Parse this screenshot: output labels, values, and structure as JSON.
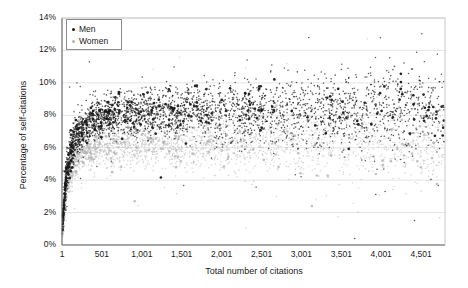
{
  "chart_data": {
    "type": "scatter",
    "title": "",
    "xlabel": "Total number of citations",
    "ylabel": "Percentage of self-citations",
    "xlim": [
      1,
      4800
    ],
    "ylim": [
      0,
      14
    ],
    "xticks": [
      1,
      501,
      1001,
      1501,
      2001,
      2501,
      3001,
      3501,
      4001,
      4501
    ],
    "xticklabels": [
      "1",
      "501",
      "1,001",
      "1,501",
      "2,001",
      "2,501",
      "3,001",
      "3,501",
      "4,001",
      "4,501"
    ],
    "yticks": [
      0,
      2,
      4,
      6,
      8,
      10,
      12,
      14
    ],
    "yticklabels": [
      "0%",
      "2%",
      "4%",
      "6%",
      "8%",
      "10%",
      "12%",
      "14%"
    ],
    "grid": "horizontal",
    "legend_position": "top-left",
    "series": [
      {
        "name": "Men",
        "color": "#1a1a1a",
        "marker": "circle",
        "description": "Dense dark band rising steeply from near 0% at x=1 to about 8% by x=500, then broadly flat near 8-8.5% with widening spread to the right; outliers up to ~13% and down to ~2%.",
        "trend_x": [
          1,
          60,
          150,
          300,
          500,
          900,
          1400,
          2000,
          2600,
          3200,
          3800,
          4400,
          4800
        ],
        "trend_y": [
          0.9,
          4.6,
          6.5,
          7.4,
          7.9,
          8.1,
          8.2,
          8.2,
          8.3,
          8.3,
          8.3,
          8.3,
          8.3
        ],
        "spread_y": [
          0.5,
          0.9,
          0.9,
          0.95,
          1.0,
          1.1,
          1.25,
          1.4,
          1.6,
          1.75,
          1.9,
          2.05,
          2.1
        ],
        "n_points": 3400
      },
      {
        "name": "Women",
        "color": "#b3b3b3",
        "marker": "circle",
        "description": "Lighter gray band below the men band, rising from near 0% at x=1 to about 6% by x=500, flat near 6-6.3% with widening spread to the right; sparse at high citation counts.",
        "trend_x": [
          1,
          60,
          150,
          300,
          500,
          900,
          1400,
          2000,
          2600,
          3200,
          3800,
          4400,
          4800
        ],
        "trend_y": [
          0.8,
          3.7,
          5.2,
          5.8,
          6.1,
          6.2,
          6.3,
          6.3,
          6.3,
          6.3,
          6.3,
          6.3,
          6.3
        ],
        "spread_y": [
          0.45,
          0.8,
          0.85,
          0.9,
          0.95,
          1.05,
          1.2,
          1.35,
          1.5,
          1.65,
          1.8,
          1.9,
          2.0
        ],
        "n_points": 2600
      }
    ]
  },
  "legend": {
    "items": [
      {
        "label": "Men",
        "color": "#1a1a1a"
      },
      {
        "label": "Women",
        "color": "#b3b3b3"
      }
    ]
  }
}
